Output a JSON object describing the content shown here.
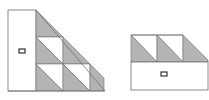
{
  "figure": {
    "colors": {
      "fill_gray": "#b4b4b4",
      "fill_white": "#ffffff",
      "stroke": "#6e6e6e",
      "marker": "#333333"
    },
    "left_diagram": {
      "label": "left-assembly",
      "rect_marker": "rectangle-marker",
      "rows": 3
    },
    "right_diagram": {
      "label": "right-assembly",
      "rect_marker": "rectangle-marker",
      "columns": 3
    }
  }
}
